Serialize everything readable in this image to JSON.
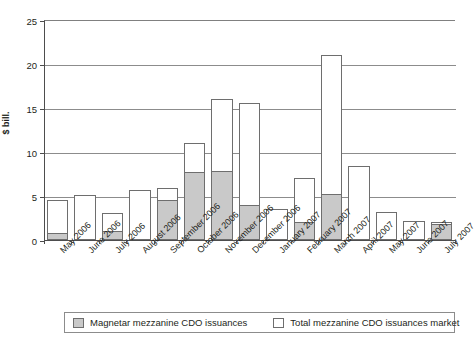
{
  "chart_data": {
    "type": "bar",
    "title": "",
    "subtitle": "",
    "xlabel": "",
    "ylabel": "$ bill.",
    "ylim": [
      0,
      25
    ],
    "yticks": [
      0,
      5,
      10,
      15,
      20,
      25
    ],
    "grid": true,
    "stacked_overlay": true,
    "legend_position": "bottom",
    "categories": [
      "May 2006",
      "June 2006",
      "July 2006",
      "August 2006",
      "September 2006",
      "October 2006",
      "November 2006",
      "December 2006",
      "January 2007",
      "February 2007",
      "March 2007",
      "April 2007",
      "May 2007",
      "June 2007",
      "July 2007"
    ],
    "series": [
      {
        "name": "Total mezzanine CDO issuances market",
        "color": "#ffffff",
        "values": [
          4.6,
          5.1,
          3.1,
          5.7,
          5.9,
          11.0,
          16.0,
          15.6,
          3.5,
          7.1,
          21.0,
          8.4,
          3.2,
          2.2,
          2.1
        ]
      },
      {
        "name": "Magnetar mezzanine CDO issuances",
        "color": "#c9c9c9",
        "values": [
          0.8,
          0.0,
          1.0,
          0.0,
          4.5,
          7.7,
          7.8,
          4.0,
          0.0,
          2.0,
          5.2,
          0.0,
          0.0,
          0.0,
          1.8
        ]
      }
    ]
  },
  "legend": {
    "items": [
      {
        "label": "Magnetar mezzanine CDO issuances",
        "swatch": "gray-swatch-icon"
      },
      {
        "label": "Total mezzanine CDO issuances market",
        "swatch": "white-swatch-icon"
      }
    ]
  }
}
